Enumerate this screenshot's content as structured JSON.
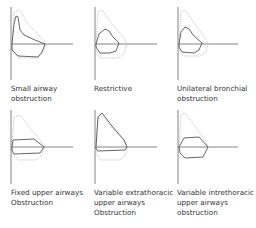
{
  "panels": [
    {
      "id": "small-airway",
      "caption_lines": [
        "Small airway",
        "obstruction"
      ]
    },
    {
      "id": "restrictive",
      "caption_lines": [
        "Restrictive"
      ]
    },
    {
      "id": "unilateral-bronchial",
      "caption_lines": [
        "Unilateral bronchial",
        "obstruction"
      ]
    },
    {
      "id": "fixed-upper",
      "caption_lines": [
        "Fixed upper airways",
        "Obstruction"
      ]
    },
    {
      "id": "variable-extrathoracic",
      "caption_lines": [
        "Variable extrathoracic",
        "upper airways",
        "Obstruction"
      ]
    },
    {
      "id": "variable-intrathoracic",
      "caption_lines": [
        "Variable intrethoracic",
        "upper airways",
        "obstruction"
      ]
    }
  ],
  "colors": {
    "curve": "#555555",
    "reference": "#bbbbbb",
    "axis": "#666666"
  }
}
